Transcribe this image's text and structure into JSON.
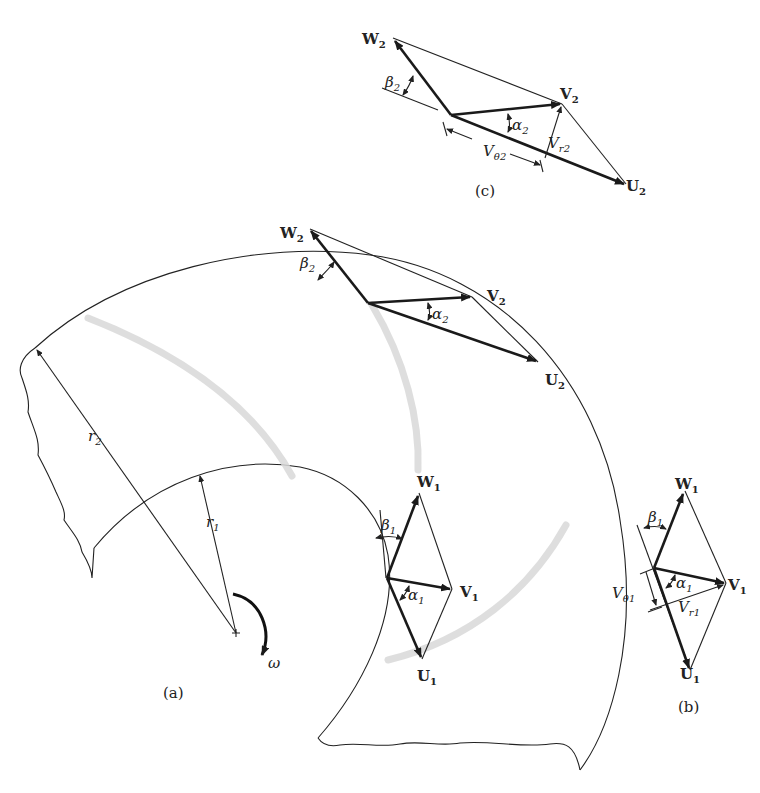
{
  "figure": {
    "panels": {
      "a": {
        "caption": "(a)"
      },
      "b": {
        "caption": "(b)"
      },
      "c": {
        "caption": "(c)"
      }
    },
    "labels": {
      "W": "W",
      "V": "V",
      "U": "U",
      "beta": "β",
      "alpha": "α",
      "r": "r",
      "omega": "ω",
      "Vtheta": "V",
      "theta_sub": "θ",
      "Vr": "V",
      "r_sub": "r",
      "sub1": "1",
      "sub2": "2"
    },
    "colors": {
      "line": "#222222",
      "blade": "#d8d8d8",
      "background": "#ffffff"
    }
  }
}
